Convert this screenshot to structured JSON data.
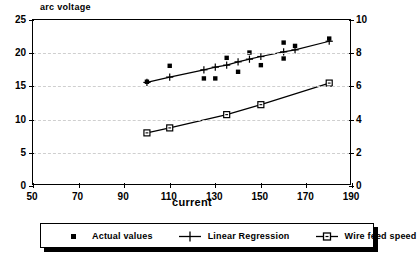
{
  "chart_data": {
    "type": "scatter",
    "title": "",
    "ylabel": "arc voltage",
    "xlabel": "current",
    "y2label": "",
    "xlim": [
      50,
      190
    ],
    "ylim": [
      0,
      25
    ],
    "y2lim": [
      0,
      10
    ],
    "xticks": [
      50,
      70,
      90,
      110,
      130,
      150,
      170,
      190
    ],
    "yticks": [
      0,
      5,
      10,
      15,
      20,
      25
    ],
    "y2ticks": [
      0,
      2,
      4,
      6,
      8,
      10
    ],
    "grid": "horizontal-dashed",
    "legend_position": "below-plot",
    "series": [
      {
        "name": "Actual values",
        "axis": "left",
        "marker": "filled-square",
        "line": false,
        "points": [
          {
            "x": 100,
            "y": 15.7
          },
          {
            "x": 110,
            "y": 18.1
          },
          {
            "x": 125,
            "y": 16.2
          },
          {
            "x": 130,
            "y": 16.2
          },
          {
            "x": 135,
            "y": 19.3
          },
          {
            "x": 140,
            "y": 17.2
          },
          {
            "x": 145,
            "y": 20.1
          },
          {
            "x": 150,
            "y": 18.2
          },
          {
            "x": 160,
            "y": 21.6
          },
          {
            "x": 160,
            "y": 19.2
          },
          {
            "x": 165,
            "y": 21.1
          },
          {
            "x": 180,
            "y": 22.2
          }
        ]
      },
      {
        "name": "Linear Regression",
        "axis": "left",
        "marker": "plus",
        "line": true,
        "points": [
          {
            "x": 100,
            "y": 15.6
          },
          {
            "x": 110,
            "y": 16.4
          },
          {
            "x": 125,
            "y": 17.5
          },
          {
            "x": 130,
            "y": 17.9
          },
          {
            "x": 135,
            "y": 18.2
          },
          {
            "x": 140,
            "y": 18.7
          },
          {
            "x": 145,
            "y": 19.1
          },
          {
            "x": 150,
            "y": 19.5
          },
          {
            "x": 160,
            "y": 20.2
          },
          {
            "x": 165,
            "y": 20.5
          },
          {
            "x": 180,
            "y": 21.8
          }
        ]
      },
      {
        "name": "Wire feed speed",
        "axis": "right",
        "marker": "open-square",
        "line": true,
        "points": [
          {
            "x": 100,
            "y": 3.2
          },
          {
            "x": 110,
            "y": 3.5
          },
          {
            "x": 135,
            "y": 4.3
          },
          {
            "x": 150,
            "y": 4.9
          },
          {
            "x": 180,
            "y": 6.2
          }
        ]
      }
    ]
  },
  "legend": {
    "items": [
      {
        "label": "Actual values",
        "key": "filled-square-marker"
      },
      {
        "label": "Linear Regression",
        "key": "plus-line-marker"
      },
      {
        "label": "Wire feed speed",
        "key": "open-square-line-marker"
      }
    ]
  },
  "colors": {
    "foreground": "#000000",
    "background": "#ffffff",
    "grid": "#cfcfcf"
  }
}
